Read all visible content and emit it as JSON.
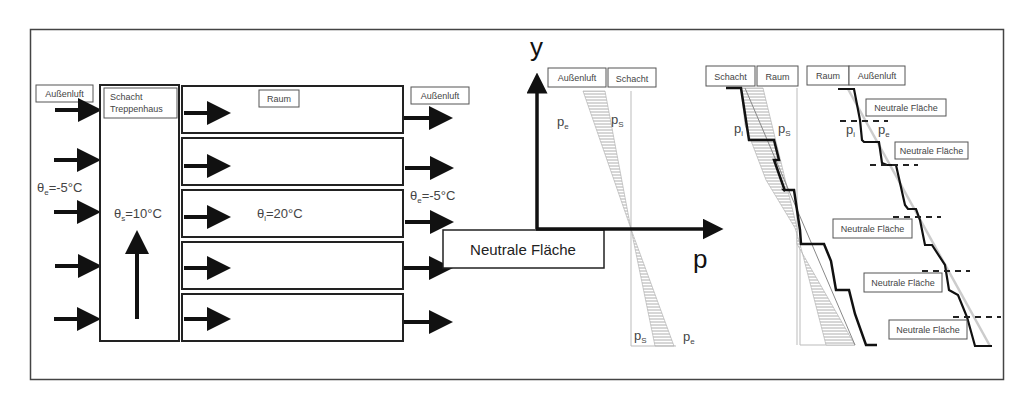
{
  "diagram": {
    "left_panel": {
      "outside_air_left_label": "Außenluft",
      "outside_air_right_label": "Außenluft",
      "shaft_label_line1": "Schacht",
      "shaft_label_line2": "Treppenhaus",
      "room_label": "Raum",
      "temp_outside_left": {
        "symbol": "θ",
        "sub": "e",
        "value": "=-5°C"
      },
      "temp_outside_right": {
        "symbol": "θ",
        "sub": "e",
        "value": "=-5°C"
      },
      "temp_shaft": {
        "symbol": "θ",
        "sub": "s",
        "value": "=10°C"
      },
      "temp_room": {
        "symbol": "θ",
        "sub": "i",
        "value": "=20°C"
      },
      "room_count": 5,
      "inflow_arrows": 5,
      "outflow_arrows": 5
    },
    "middle_panel": {
      "neutral_plane_label": "Neutrale Fläche",
      "y_axis_label": "y",
      "x_axis_label": "p",
      "header_left": "Außenluft",
      "header_right": "Schacht",
      "upper_left": {
        "symbol": "p",
        "sub": "e"
      },
      "upper_right": {
        "symbol": "p",
        "sub": "S"
      },
      "lower_left": {
        "symbol": "p",
        "sub": "S"
      },
      "lower_right": {
        "symbol": "p",
        "sub": "e"
      }
    },
    "right_panel_a": {
      "header_left": "Schacht",
      "header_right": "Raum",
      "left_curve": {
        "symbol": "p",
        "sub": "i"
      },
      "right_curve": {
        "symbol": "p",
        "sub": "S"
      }
    },
    "right_panel_b": {
      "header_left": "Raum",
      "header_right": "Außenluft",
      "left_curve": {
        "symbol": "p",
        "sub": "i"
      },
      "right_curve": {
        "symbol": "p",
        "sub": "e"
      },
      "neutral_labels": [
        "Neutrale Fläche",
        "Neutrale Fläche",
        "Neutrale Fläche",
        "Neutrale Fläche",
        "Neutrale Fläche"
      ]
    }
  }
}
